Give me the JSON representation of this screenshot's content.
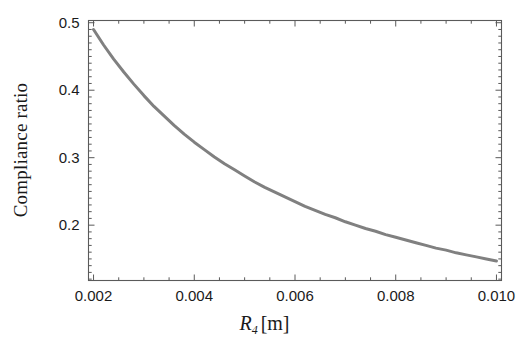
{
  "figure": {
    "background": "#ffffff",
    "frame_color": "#5a5a5a",
    "curve_color": "#808080"
  },
  "axis_titles": {
    "x_symbol": "R",
    "x_subscript": "4",
    "x_units": "[m]",
    "x_full": "R4 [m]",
    "y": "Compliance ratio"
  },
  "ticks": {
    "x_labels": [
      "0.002",
      "0.004",
      "0.006",
      "0.008",
      "0.010"
    ],
    "y_labels": [
      "0.5",
      "0.4",
      "0.3",
      "0.2"
    ]
  },
  "chart_data": {
    "type": "line",
    "title": "",
    "xlabel": "R4 [m]",
    "ylabel": "Compliance ratio",
    "xlim": [
      0.0019,
      0.0101
    ],
    "ylim": [
      0.118,
      0.5033
    ],
    "xticks": [
      0.002,
      0.004,
      0.006,
      0.008,
      0.01
    ],
    "xticklabels": [
      "0.002",
      "0.004",
      "0.006",
      "0.008",
      "0.010"
    ],
    "yticks": [
      0.2,
      0.3,
      0.4,
      0.5
    ],
    "yticklabels": [
      "0.2",
      "0.3",
      "0.4",
      "0.5"
    ],
    "grid": false,
    "legend": null,
    "minor_ticks": true,
    "frame": "box",
    "series": [
      {
        "name": "Compliance ratio",
        "color": "#808080",
        "linewidth": 3,
        "x": [
          0.002,
          0.0022,
          0.0024,
          0.0026,
          0.0028,
          0.003,
          0.0032,
          0.0034,
          0.0036,
          0.0038,
          0.004,
          0.0042,
          0.0044,
          0.0046,
          0.0048,
          0.005,
          0.0052,
          0.0054,
          0.0056,
          0.0058,
          0.006,
          0.0062,
          0.0064,
          0.0066,
          0.0068,
          0.007,
          0.0072,
          0.0074,
          0.0076,
          0.0078,
          0.008,
          0.0082,
          0.0084,
          0.0086,
          0.0088,
          0.009,
          0.0092,
          0.0094,
          0.0096,
          0.0098,
          0.01
        ],
        "y": [
          0.49,
          0.467,
          0.446,
          0.427,
          0.409,
          0.392,
          0.376,
          0.362,
          0.348,
          0.335,
          0.323,
          0.312,
          0.301,
          0.291,
          0.282,
          0.273,
          0.264,
          0.256,
          0.249,
          0.242,
          0.235,
          0.228,
          0.222,
          0.216,
          0.211,
          0.205,
          0.2,
          0.195,
          0.191,
          0.186,
          0.182,
          0.178,
          0.174,
          0.17,
          0.166,
          0.163,
          0.159,
          0.156,
          0.153,
          0.15,
          0.147
        ]
      }
    ]
  }
}
